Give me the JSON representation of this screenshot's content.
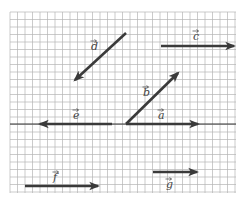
{
  "diagram": {
    "type": "vector-diagram",
    "grid": {
      "x0": 10,
      "y0": 12,
      "x1": 236,
      "y1": 193,
      "spacing": 7.5,
      "color": "#b4b4b4"
    },
    "axis": {
      "y": 124,
      "x0": 10,
      "x1": 236,
      "color": "#333333"
    },
    "vector_color": "#3a3a3a",
    "vectors": [
      {
        "name": "d",
        "label": "d",
        "x1": 126,
        "y1": 33,
        "x2": 75,
        "y2": 80,
        "lx": 91,
        "ly": 50
      },
      {
        "name": "c",
        "label": "c",
        "x1": 161,
        "y1": 46,
        "x2": 234,
        "y2": 46,
        "lx": 193,
        "ly": 40
      },
      {
        "name": "e",
        "label": "e",
        "x1": 112,
        "y1": 124,
        "x2": 40,
        "y2": 124,
        "lx": 73,
        "ly": 119
      },
      {
        "name": "b",
        "label": "b",
        "x1": 126,
        "y1": 124,
        "x2": 178,
        "y2": 73,
        "lx": 143,
        "ly": 96
      },
      {
        "name": "a",
        "label": "a",
        "x1": 126,
        "y1": 124,
        "x2": 198,
        "y2": 124,
        "lx": 158,
        "ly": 119
      },
      {
        "name": "f",
        "label": "f",
        "x1": 25,
        "y1": 186,
        "x2": 98,
        "y2": 186,
        "lx": 53,
        "ly": 181
      },
      {
        "name": "g",
        "label": "g",
        "x1": 153,
        "y1": 172,
        "x2": 197,
        "y2": 172,
        "lx": 166,
        "ly": 188
      }
    ]
  }
}
